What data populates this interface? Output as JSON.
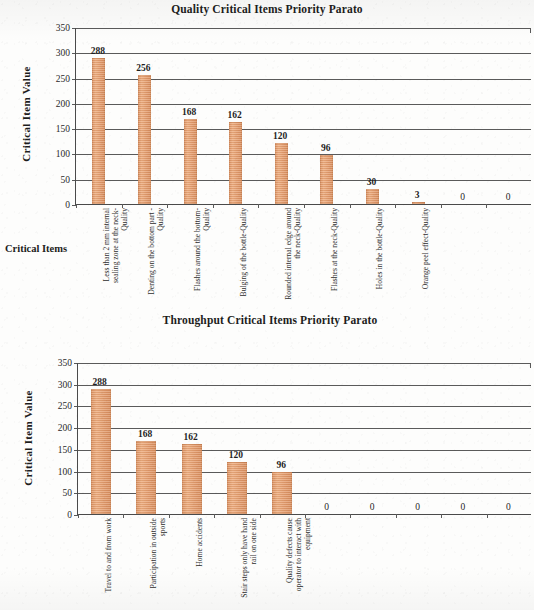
{
  "document": {
    "kind": "scanned-figure-page",
    "axis_color": "#4a4a4a",
    "bar_color": "#e8a476",
    "text_color": "#262626"
  },
  "charts": [
    {
      "id": "quality",
      "title": "Quality Critical Items Priority Parato",
      "ylabel": "Critical Item Value",
      "xlabel": "Critical Items",
      "yticks": [
        "350",
        "300",
        "250",
        "200",
        "150",
        "100",
        "50",
        "0"
      ],
      "categories": [
        "Less than 2 mm internal sealing zone at the neck-Quality",
        "Denting on the bottom part -Quality",
        "Flashes around the bottom-Quality",
        "Bulging of the bottle-Quality",
        "Rounded internal edge around the neck-Quality",
        "Flashes at the neck-Quality",
        "Holes in the bottle-Quality",
        "Orange peel effect-Quality",
        "",
        ""
      ],
      "values": [
        288,
        256,
        168,
        162,
        120,
        96,
        30,
        3,
        0,
        0
      ],
      "value_labels": [
        "288",
        "256",
        "168",
        "162",
        "120",
        "96",
        "30",
        "3",
        "0",
        "0"
      ]
    },
    {
      "id": "throughput",
      "title": "Throughput Critical Items Priority Parato",
      "ylabel": "Critical Item Value",
      "xlabel": "Critical Items",
      "yticks": [
        "350",
        "300",
        "250",
        "200",
        "150",
        "100",
        "50",
        "0"
      ],
      "categories": [
        "Travel to and from work",
        "Participation in outside sports",
        "Home accidents",
        "Stair steps only have hand rail on one side",
        "Quality defects cause operator to interact with equipment",
        "",
        "",
        "",
        "",
        ""
      ],
      "values": [
        288,
        168,
        162,
        120,
        96,
        0,
        0,
        0,
        0,
        0
      ],
      "value_labels": [
        "288",
        "168",
        "162",
        "120",
        "96",
        "0",
        "0",
        "0",
        "0",
        "0"
      ]
    }
  ],
  "chart_data": [
    {
      "type": "bar",
      "title": "Quality Critical Items Priority Parato",
      "xlabel": "Critical Items",
      "ylabel": "Critical Item Value",
      "ylim": [
        0,
        350
      ],
      "ytick_step": 50,
      "grid": true,
      "legend": "none",
      "categories": [
        "Less than 2 mm internal sealing zone at the neck-Quality",
        "Denting on the bottom part -Quality",
        "Flashes around the bottom-Quality",
        "Bulging of the bottle-Quality",
        "Rounded internal edge around the neck-Quality",
        "Flashes at the neck-Quality",
        "Holes in the bottle-Quality",
        "Orange peel effect-Quality",
        "",
        ""
      ],
      "values": [
        288,
        256,
        168,
        162,
        120,
        96,
        30,
        3,
        0,
        0
      ],
      "bar_color": "#e8a476"
    },
    {
      "type": "bar",
      "title": "Throughput Critical Items Priority Parato",
      "xlabel": "Critical Items",
      "ylabel": "Critical Item Value",
      "ylim": [
        0,
        350
      ],
      "ytick_step": 50,
      "grid": true,
      "legend": "none",
      "categories": [
        "Travel to and from work",
        "Participation in outside sports",
        "Home accidents",
        "Stair steps only have hand rail on one side",
        "Quality defects cause operator to interact with equipment",
        "",
        "",
        "",
        "",
        ""
      ],
      "values": [
        288,
        168,
        162,
        120,
        96,
        0,
        0,
        0,
        0,
        0
      ],
      "bar_color": "#e8a476"
    }
  ]
}
